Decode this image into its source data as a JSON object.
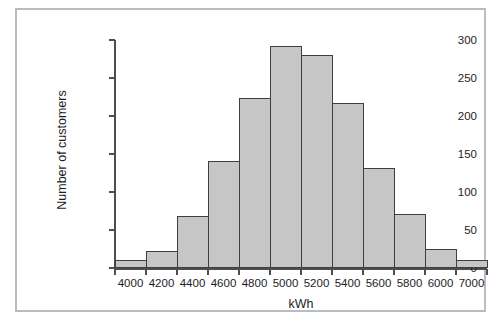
{
  "chart_data": {
    "type": "bar",
    "title": "",
    "subtitle": "",
    "xlabel": "kWh",
    "ylabel": "Number of customers",
    "categories": [
      "4000",
      "4200",
      "4400",
      "4600",
      "4800",
      "5000",
      "5200",
      "5400",
      "5600",
      "5800",
      "6000",
      "7000"
    ],
    "bin_edges": [
      3900,
      4100,
      4300,
      4500,
      4700,
      4900,
      5100,
      5300,
      5500,
      5700,
      5900,
      6100,
      7100
    ],
    "values": [
      10,
      22,
      69,
      141,
      224,
      292,
      280,
      217,
      131,
      71,
      25,
      10
    ],
    "xtick_labels": [
      "4000",
      "4200",
      "4400",
      "4600",
      "4800",
      "5000",
      "5200",
      "5400",
      "5600",
      "5800",
      "6000",
      "7000"
    ],
    "ytick_labels": [
      "0",
      "50",
      "100",
      "150",
      "200",
      "250",
      "300"
    ],
    "ytick_values": [
      0,
      50,
      100,
      150,
      200,
      250,
      300
    ],
    "ylim": [
      0,
      300
    ],
    "grid": false,
    "legend": null,
    "bar_fill_color": "#c6c6c6",
    "bar_edge_color": "#3f3f3f",
    "axis_color": "#4e4e4e",
    "frame_color": "#b9bcc2",
    "background_color": "#ffffff"
  }
}
